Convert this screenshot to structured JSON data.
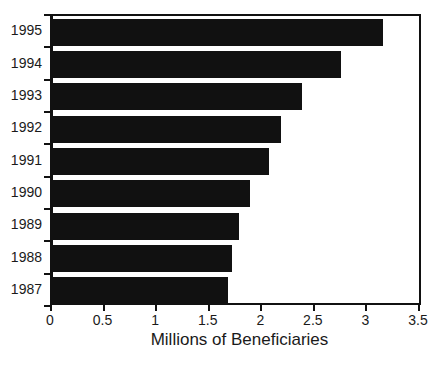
{
  "chart_data": {
    "type": "bar",
    "orientation": "horizontal",
    "title": "",
    "subtitle": "",
    "xlabel": "Millions of Beneficiaries",
    "ylabel": "",
    "xlim": [
      0,
      3.5
    ],
    "xticks": [
      "0",
      "0.5",
      "1",
      "1.5",
      "2",
      "2.5",
      "3",
      "3.5"
    ],
    "xtick_values": [
      0,
      0.5,
      1,
      1.5,
      2,
      2.5,
      3,
      3.5
    ],
    "grid": false,
    "legend": null,
    "bar_color": "#111111",
    "axis_color": "#111111",
    "background": "#ffffff",
    "categories": [
      "1995",
      "1994",
      "1993",
      "1992",
      "1991",
      "1990",
      "1989",
      "1988",
      "1987"
    ],
    "values": [
      3.14,
      2.74,
      2.37,
      2.17,
      2.05,
      1.87,
      1.77,
      1.7,
      1.66
    ],
    "points": [
      {
        "category": "1995",
        "value": 3.14
      },
      {
        "category": "1994",
        "value": 2.74
      },
      {
        "category": "1993",
        "value": 2.37
      },
      {
        "category": "1992",
        "value": 2.17
      },
      {
        "category": "1991",
        "value": 2.05
      },
      {
        "category": "1990",
        "value": 1.87
      },
      {
        "category": "1989",
        "value": 1.77
      },
      {
        "category": "1988",
        "value": 1.7
      },
      {
        "category": "1987",
        "value": 1.66
      }
    ]
  }
}
